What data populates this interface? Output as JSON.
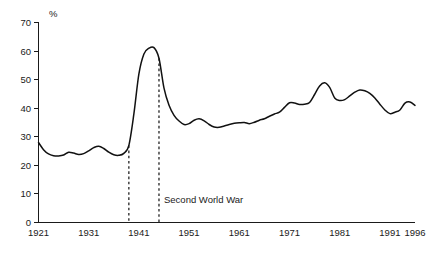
{
  "chart_data": {
    "type": "line",
    "title": "",
    "xlabel": "",
    "ylabel": "%",
    "ylim": [
      0,
      70
    ],
    "xlim": [
      1921,
      1996
    ],
    "grid": false,
    "legend": "none",
    "y_ticks": [
      0,
      10,
      20,
      30,
      40,
      50,
      60,
      70
    ],
    "y_tick_labels": [
      "0",
      "10",
      "20",
      "30",
      "40",
      "50",
      "60",
      "70"
    ],
    "x_ticks": [
      1921,
      1931,
      1941,
      1951,
      1961,
      1971,
      1981,
      1991,
      1996
    ],
    "x_tick_labels": [
      "1921",
      "1931",
      "1941",
      "1951",
      "1961",
      "1971",
      "1981",
      "1991",
      "1996"
    ],
    "series": [
      {
        "name": "share",
        "x": [
          1921,
          1922,
          1923,
          1924,
          1925,
          1926,
          1927,
          1928,
          1929,
          1930,
          1931,
          1932,
          1933,
          1934,
          1935,
          1936,
          1937,
          1938,
          1939,
          1940,
          1941,
          1942,
          1943,
          1944,
          1945,
          1946,
          1947,
          1948,
          1949,
          1950,
          1951,
          1952,
          1953,
          1954,
          1955,
          1956,
          1957,
          1958,
          1959,
          1960,
          1961,
          1962,
          1963,
          1964,
          1965,
          1966,
          1967,
          1968,
          1969,
          1970,
          1971,
          1972,
          1973,
          1974,
          1975,
          1976,
          1977,
          1978,
          1979,
          1980,
          1981,
          1982,
          1983,
          1984,
          1985,
          1986,
          1987,
          1988,
          1989,
          1990,
          1991,
          1992,
          1993,
          1994,
          1995,
          1996
        ],
        "values": [
          28.0,
          25.5,
          24.0,
          23.4,
          23.3,
          23.6,
          24.6,
          24.3,
          23.8,
          24.1,
          25.1,
          26.2,
          26.7,
          25.9,
          24.6,
          23.7,
          23.5,
          24.2,
          27.0,
          38.0,
          52.0,
          59.0,
          61.0,
          61.2,
          57.5,
          47.0,
          41.0,
          37.5,
          35.5,
          34.3,
          34.6,
          35.8,
          36.3,
          35.6,
          34.3,
          33.4,
          33.3,
          33.8,
          34.3,
          34.7,
          34.9,
          35.0,
          34.6,
          35.1,
          35.8,
          36.3,
          37.2,
          38.0,
          38.6,
          40.3,
          41.9,
          41.8,
          41.3,
          41.4,
          42.0,
          44.8,
          47.8,
          48.9,
          47.3,
          43.6,
          42.7,
          43.0,
          44.3,
          45.6,
          46.4,
          46.1,
          45.2,
          43.6,
          41.4,
          39.4,
          38.1,
          38.6,
          39.4,
          41.8,
          42.2,
          41.0
        ]
      }
    ],
    "annotations": [
      {
        "name": "second-world-war",
        "label": "Second World War",
        "start_x": 1939,
        "end_x": 1945,
        "label_x": 1946,
        "label_y": 6.8
      }
    ]
  }
}
